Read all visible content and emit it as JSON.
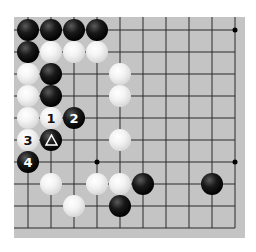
{
  "board": {
    "background": "#c4c4c4",
    "line_color": "#2a2a2a",
    "columns": 10,
    "rows": 10,
    "col_x": [
      28,
      51,
      74,
      97,
      120,
      143,
      166,
      189,
      212,
      235
    ],
    "row_y": [
      30,
      52,
      74,
      96,
      118,
      140,
      162,
      184,
      206,
      228
    ],
    "open_edges": [
      "left-outside",
      "bottom-outside"
    ],
    "star_points": [
      {
        "col": 9,
        "row": 0
      },
      {
        "col": 3,
        "row": 6
      },
      {
        "col": 9,
        "row": 6
      }
    ]
  },
  "stones": [
    {
      "color": "black",
      "col": 0,
      "row": 0,
      "label": ""
    },
    {
      "color": "black",
      "col": 1,
      "row": 0,
      "label": ""
    },
    {
      "color": "black",
      "col": 2,
      "row": 0,
      "label": ""
    },
    {
      "color": "black",
      "col": 3,
      "row": 0,
      "label": ""
    },
    {
      "color": "black",
      "col": 0,
      "row": 1,
      "label": ""
    },
    {
      "color": "white",
      "col": 1,
      "row": 1,
      "label": ""
    },
    {
      "color": "white",
      "col": 2,
      "row": 1,
      "label": ""
    },
    {
      "color": "white",
      "col": 3,
      "row": 1,
      "label": ""
    },
    {
      "color": "white",
      "col": 0,
      "row": 2,
      "label": ""
    },
    {
      "color": "black",
      "col": 1,
      "row": 2,
      "label": ""
    },
    {
      "color": "white",
      "col": 4,
      "row": 2,
      "label": ""
    },
    {
      "color": "white",
      "col": 0,
      "row": 3,
      "label": ""
    },
    {
      "color": "black",
      "col": 1,
      "row": 3,
      "label": ""
    },
    {
      "color": "white",
      "col": 4,
      "row": 3,
      "label": ""
    },
    {
      "color": "white",
      "col": 0,
      "row": 4,
      "label": ""
    },
    {
      "color": "white",
      "col": 1,
      "row": 4,
      "label": "1"
    },
    {
      "color": "black",
      "col": 2,
      "row": 4,
      "label": "2"
    },
    {
      "color": "white",
      "col": 0,
      "row": 5,
      "label": "3"
    },
    {
      "color": "black",
      "col": 1,
      "row": 5,
      "label": "",
      "marker": "triangle"
    },
    {
      "color": "white",
      "col": 4,
      "row": 5,
      "label": ""
    },
    {
      "color": "black",
      "col": 0,
      "row": 6,
      "label": "4"
    },
    {
      "color": "white",
      "col": 1,
      "row": 7,
      "label": ""
    },
    {
      "color": "white",
      "col": 3,
      "row": 7,
      "label": ""
    },
    {
      "color": "white",
      "col": 4,
      "row": 7,
      "label": ""
    },
    {
      "color": "black",
      "col": 5,
      "row": 7,
      "label": ""
    },
    {
      "color": "black",
      "col": 8,
      "row": 7,
      "label": ""
    },
    {
      "color": "white",
      "col": 2,
      "row": 8,
      "label": ""
    },
    {
      "color": "black",
      "col": 4,
      "row": 8,
      "label": ""
    }
  ],
  "move_labels": [
    "1",
    "2",
    "3",
    "4"
  ],
  "markers": [
    {
      "type": "triangle-icon",
      "on": "black",
      "col": 1,
      "row": 5
    }
  ]
}
